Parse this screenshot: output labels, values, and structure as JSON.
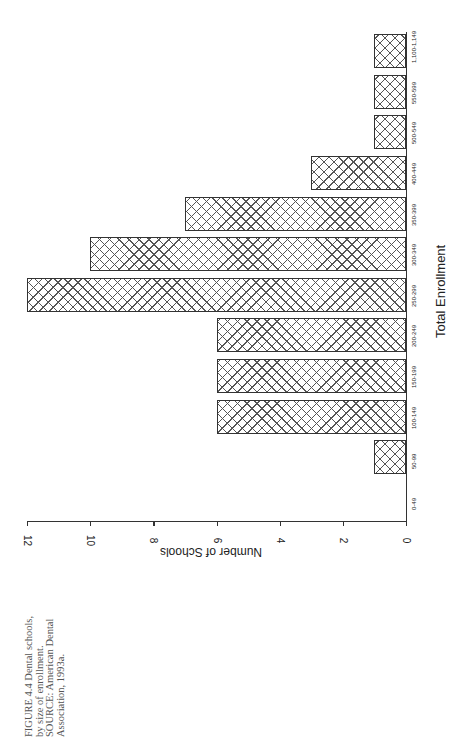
{
  "chart_data": {
    "type": "bar",
    "orientation": "rotated-vertical",
    "title": "",
    "xlabel": "Total Enrollment",
    "ylabel": "Number of Schools",
    "categories": [
      "0-49",
      "50-99",
      "100-149",
      "150-199",
      "200-249",
      "250-299",
      "300-349",
      "350-399",
      "400-449",
      "500-549",
      "550-599",
      "1,100-1,149"
    ],
    "values": [
      0,
      1,
      6,
      6,
      6,
      12,
      10,
      7,
      3,
      1,
      1,
      1
    ],
    "ylim": [
      0,
      12
    ],
    "yticks": [
      0,
      2,
      4,
      6,
      8,
      10,
      12
    ],
    "grid": false,
    "legend": null,
    "fill": "crosshatch"
  },
  "caption": {
    "lines": [
      "FIGURE 4.4  Dental schools,",
      "by size of enrollment.",
      "SOURCE:  American Dental",
      "Association, 1993a."
    ]
  }
}
